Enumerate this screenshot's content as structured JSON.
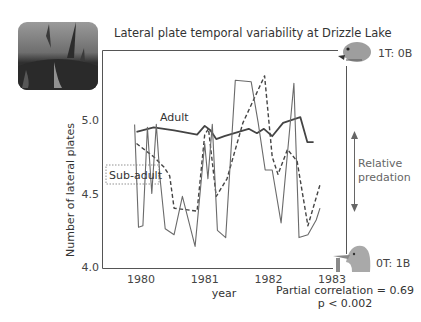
{
  "title": "Lateral plate temporal variability at Drizzle Lake",
  "photo": {
    "alt": "stickleback-spines-photo"
  },
  "annotations": {
    "top_fish": "1T: 0B",
    "bottom_bird": "0T: 1B",
    "predation_label_line1": "Relative",
    "predation_label_line2": "predation",
    "stats_line1": "Partial correlation = 0.69",
    "stats_line2": "p < 0.002"
  },
  "chart_data": {
    "type": "line",
    "title": "Lateral plate temporal variability at Drizzle Lake",
    "xlabel": "year",
    "ylabel": "Number of lateral plates",
    "xlim": [
      1979.4,
      1983.2
    ],
    "ylim": [
      4.0,
      5.45
    ],
    "xticks": [
      1980,
      1981,
      1982,
      1983
    ],
    "xtick_labels": [
      "1980",
      "1981",
      "1982",
      "1983"
    ],
    "yticks": [
      4.0,
      4.5,
      5.0
    ],
    "ytick_labels": [
      "4.0",
      "4.5",
      "5.0"
    ],
    "grid": false,
    "legend": "inline labels",
    "series": [
      {
        "name": "Adult",
        "style": "solid-thick",
        "color": "#444444",
        "points": [
          [
            1979.93,
            4.92
          ],
          [
            1980.2,
            4.95
          ],
          [
            1980.52,
            4.93
          ],
          [
            1980.88,
            4.9
          ],
          [
            1981.0,
            4.96
          ],
          [
            1981.09,
            4.93
          ],
          [
            1981.18,
            4.87
          ],
          [
            1981.31,
            4.89
          ],
          [
            1981.69,
            4.94
          ],
          [
            1981.82,
            4.91
          ],
          [
            1981.93,
            4.94
          ],
          [
            1982.06,
            4.89
          ],
          [
            1982.23,
            4.98
          ],
          [
            1982.5,
            5.02
          ],
          [
            1982.61,
            4.85
          ],
          [
            1982.71,
            4.85
          ]
        ]
      },
      {
        "name": "Sub-adult",
        "style": "dashed",
        "color": "#444444",
        "points": [
          [
            1979.93,
            4.84
          ],
          [
            1980.2,
            4.75
          ],
          [
            1980.36,
            4.68
          ],
          [
            1980.45,
            4.62
          ],
          [
            1980.52,
            4.4
          ],
          [
            1980.88,
            4.38
          ],
          [
            1981.0,
            4.9
          ],
          [
            1981.06,
            4.94
          ],
          [
            1981.18,
            4.48
          ],
          [
            1981.35,
            4.6
          ],
          [
            1981.6,
            4.98
          ],
          [
            1981.94,
            5.3
          ],
          [
            1982.06,
            4.75
          ],
          [
            1982.15,
            4.63
          ],
          [
            1982.3,
            4.8
          ],
          [
            1982.45,
            4.72
          ],
          [
            1982.62,
            4.28
          ],
          [
            1982.81,
            4.56
          ]
        ]
      },
      {
        "name": "Sub-adult (raw)",
        "style": "solid-thin",
        "color": "#6a6a6a",
        "points": [
          [
            1979.9,
            4.97
          ],
          [
            1979.96,
            4.27
          ],
          [
            1980.03,
            4.28
          ],
          [
            1980.1,
            4.95
          ],
          [
            1980.17,
            4.5
          ],
          [
            1980.24,
            4.97
          ],
          [
            1980.3,
            4.6
          ],
          [
            1980.38,
            4.26
          ],
          [
            1980.52,
            4.22
          ],
          [
            1980.65,
            4.48
          ],
          [
            1980.85,
            4.14
          ],
          [
            1981.0,
            4.84
          ],
          [
            1981.05,
            4.6
          ],
          [
            1981.12,
            4.97
          ],
          [
            1981.2,
            4.25
          ],
          [
            1981.33,
            4.2
          ],
          [
            1981.48,
            5.27
          ],
          [
            1981.73,
            5.26
          ],
          [
            1981.84,
            4.98
          ],
          [
            1981.95,
            4.66
          ],
          [
            1982.06,
            4.66
          ],
          [
            1982.2,
            4.3
          ],
          [
            1982.4,
            5.25
          ],
          [
            1982.48,
            4.2
          ],
          [
            1982.62,
            4.22
          ],
          [
            1982.75,
            4.32
          ],
          [
            1982.81,
            4.4
          ]
        ]
      }
    ],
    "inline_labels": [
      {
        "text": "Adult",
        "series": "Adult"
      },
      {
        "text": "Sub-adult",
        "series": "Sub-adult",
        "boxed": true,
        "box_style": "dotted"
      }
    ]
  }
}
